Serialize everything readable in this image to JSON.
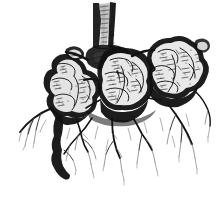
{
  "figure": {
    "kind": "botanical-engraving",
    "technique": "pen-and-ink line engraving with stipple and cross-hatching",
    "background_color": "#ffffff",
    "ink_color": "#111111",
    "canvas": {
      "width": 223,
      "height": 198
    },
    "ink_extents": {
      "left": 18,
      "top": 2,
      "right": 212,
      "bottom": 186
    },
    "caption": "",
    "parts": [
      {
        "name": "cut-stem",
        "label": "Cut stem",
        "region": [
          93,
          2,
          24,
          48
        ]
      },
      {
        "name": "crown",
        "label": "Root crown",
        "region": [
          88,
          44,
          48,
          26
        ]
      },
      {
        "name": "left-tuber-cluster",
        "label": "Left clubbed tubers",
        "region": [
          40,
          52,
          66,
          66
        ]
      },
      {
        "name": "central-tuber-mass",
        "label": "Central clubbed tuber mass",
        "region": [
          100,
          48,
          62,
          70
        ]
      },
      {
        "name": "right-tuber-cluster",
        "label": "Right clubbed tubers",
        "region": [
          150,
          36,
          62,
          74
        ]
      },
      {
        "name": "fibrous-roots",
        "label": "Fibrous lateral roots",
        "region": [
          18,
          110,
          194,
          76
        ]
      },
      {
        "name": "taproot-stub",
        "label": "Descending root stub",
        "region": [
          48,
          130,
          26,
          56
        ]
      }
    ]
  }
}
